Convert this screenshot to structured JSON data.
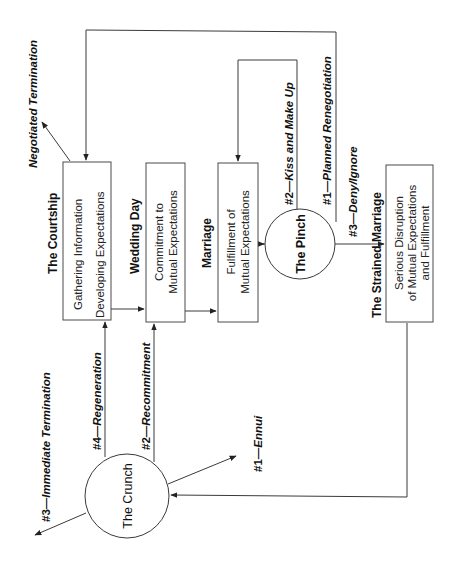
{
  "diagram": {
    "orientation": "rotated-90-ccw",
    "stages": {
      "courtship": {
        "title": "The Courtship",
        "lines": [
          "Gathering Information",
          "Developing Expectations"
        ]
      },
      "wedding_day": {
        "title": "Wedding Day",
        "lines": [
          "Commitment to",
          "Mutual Expectations"
        ]
      },
      "marriage": {
        "title": "Marriage",
        "lines": [
          "Fulfillment of",
          "Mutual Expectations"
        ]
      },
      "pinch": {
        "label": "The Pinch"
      },
      "strained": {
        "title": "The Strained Marriage",
        "lines": [
          "Serious Disruption",
          "of Mutual Expectations",
          "and Fulfillment"
        ]
      },
      "crunch": {
        "label": "The Crunch"
      }
    },
    "paths": {
      "negotiated_termination": {
        "num": "",
        "text": "Negotiated Termination"
      },
      "kiss_make_up": {
        "num": "#2—",
        "text": "Kiss and Make Up"
      },
      "planned_renegotiation": {
        "num": "#1—",
        "text": "Planned Renegotiation"
      },
      "deny_ignore": {
        "num": "#3—",
        "text": "Deny/Ignore"
      },
      "immediate_termination": {
        "num": "#3—",
        "text": "Immediate Termination"
      },
      "regeneration": {
        "num": "#4—",
        "text": "Regeneration"
      },
      "recommitment": {
        "num": "#2—",
        "text": "Recommitment"
      },
      "ennui": {
        "num": "#1—",
        "text": "Ennui"
      }
    },
    "colors": {
      "line": "#3a3a3a",
      "text": "#111111",
      "background": "#ffffff"
    }
  }
}
